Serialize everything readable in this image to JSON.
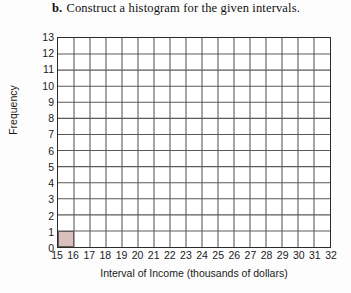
{
  "heading": {
    "label": "b.",
    "text": "Construct a histogram for the given intervals."
  },
  "chart_data": {
    "type": "bar",
    "title": "",
    "xlabel": "Interval of Income (thousands of dollars)",
    "ylabel": "Frequency",
    "x_tick_labels": [
      "15",
      "16",
      "17",
      "18",
      "19",
      "20",
      "21",
      "22",
      "23",
      "24",
      "25",
      "26",
      "27",
      "28",
      "29",
      "30",
      "31",
      "32"
    ],
    "y_tick_labels": [
      "0",
      "1",
      "2",
      "3",
      "4",
      "5",
      "6",
      "7",
      "8",
      "9",
      "10",
      "11",
      "12",
      "13"
    ],
    "xlim": [
      15,
      32
    ],
    "ylim": [
      0,
      13
    ],
    "grid": true,
    "legend": false,
    "bin_width": 1,
    "bar_color": "#d8c0bc",
    "bar_edge_color": "#6d5a57",
    "grid_color": "#5a5a5a",
    "axis_color": "#2b2b2b",
    "bins": [
      {
        "start": 15,
        "end": 16,
        "value": 1
      },
      {
        "start": 16,
        "end": 17,
        "value": 0
      },
      {
        "start": 17,
        "end": 18,
        "value": 0
      },
      {
        "start": 18,
        "end": 19,
        "value": 0
      },
      {
        "start": 19,
        "end": 20,
        "value": 0
      },
      {
        "start": 20,
        "end": 21,
        "value": 0
      },
      {
        "start": 21,
        "end": 22,
        "value": 0
      },
      {
        "start": 22,
        "end": 23,
        "value": 0
      },
      {
        "start": 23,
        "end": 24,
        "value": 0
      },
      {
        "start": 24,
        "end": 25,
        "value": 0
      },
      {
        "start": 25,
        "end": 26,
        "value": 0
      },
      {
        "start": 26,
        "end": 27,
        "value": 0
      },
      {
        "start": 27,
        "end": 28,
        "value": 0
      },
      {
        "start": 28,
        "end": 29,
        "value": 0
      },
      {
        "start": 29,
        "end": 30,
        "value": 0
      },
      {
        "start": 30,
        "end": 31,
        "value": 0
      },
      {
        "start": 31,
        "end": 32,
        "value": 0
      }
    ]
  }
}
